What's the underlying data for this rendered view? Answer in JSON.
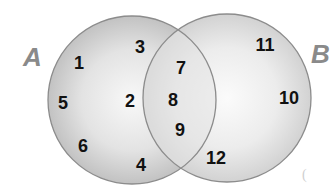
{
  "diagram": {
    "type": "venn",
    "sets": [
      {
        "name": "A",
        "label": "A",
        "only": [
          "1",
          "3",
          "5",
          "2",
          "6",
          "4"
        ]
      },
      {
        "name": "B",
        "label": "B",
        "only": [
          "11",
          "10",
          "12"
        ]
      }
    ],
    "intersection": [
      "7",
      "8",
      "9"
    ],
    "elements": [
      {
        "value": "1",
        "x": 79,
        "y": 69
      },
      {
        "value": "3",
        "x": 140,
        "y": 53
      },
      {
        "value": "5",
        "x": 63,
        "y": 109
      },
      {
        "value": "2",
        "x": 130,
        "y": 107
      },
      {
        "value": "6",
        "x": 83,
        "y": 152
      },
      {
        "value": "4",
        "x": 141,
        "y": 171
      },
      {
        "value": "7",
        "x": 181,
        "y": 74
      },
      {
        "value": "8",
        "x": 173,
        "y": 106
      },
      {
        "value": "9",
        "x": 180,
        "y": 136
      },
      {
        "value": "11",
        "x": 265,
        "y": 51
      },
      {
        "value": "10",
        "x": 289,
        "y": 104
      },
      {
        "value": "12",
        "x": 216,
        "y": 164
      }
    ],
    "stray_mark": "(",
    "colors": {
      "circle_fill_a_edge": "#c4c4c4",
      "circle_fill_b_edge": "#d6d6d6",
      "circle_center": "#f7f7f7",
      "outline": "#8c8c8c",
      "numbers": "#111111",
      "set_labels": "#8a8a8a"
    }
  }
}
